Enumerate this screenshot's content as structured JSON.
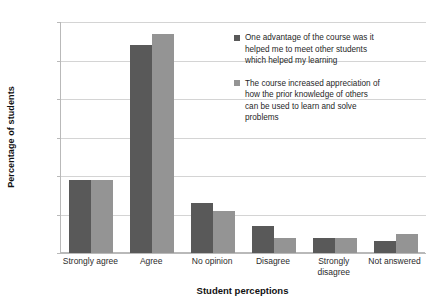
{
  "chart_data": {
    "type": "bar",
    "title": "",
    "xlabel": "Student perceptions",
    "ylabel": "Percentage of students",
    "categories": [
      "Strongly agree",
      "Agree",
      "No opinion",
      "Disagree",
      "Strongly disagree",
      "Not answered"
    ],
    "series": [
      {
        "name": "One advantage of the course was it helped me to meet other students which helped my learning",
        "color": "#595959",
        "values": [
          19,
          54,
          13,
          7,
          4,
          3
        ]
      },
      {
        "name": "The course increased appreciation of how the prior knowledge of others can be used to learn and solve problems",
        "color": "#949494",
        "values": [
          19,
          57,
          11,
          4,
          4,
          5
        ]
      }
    ],
    "ylim": [
      0,
      60
    ],
    "yticks": [
      0,
      10,
      20,
      30,
      40,
      50,
      60
    ],
    "ytick_labels": [
      "0",
      "10",
      "20",
      "30",
      "40",
      "50",
      "60"
    ],
    "grid": "horizontal",
    "legend_position": "right-inside"
  },
  "legend": {
    "entries": [
      {
        "lines": [
          "One advantage of the course was it",
          "helped me to meet other students",
          "which helped  my learning"
        ]
      },
      {
        "lines": [
          "The course increased appreciation of",
          "how the prior knowledge of others",
          "can be used to learn and solve",
          "problems"
        ]
      }
    ]
  }
}
